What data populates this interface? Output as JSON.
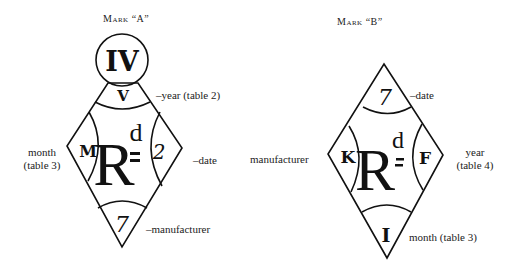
{
  "mark_a": {
    "title": "Mark “A”",
    "top_circle": "IV",
    "upper_section": "V",
    "left_section": "M",
    "center": "R",
    "center_superscript": "d",
    "right_section": "2",
    "bottom_section": "7",
    "annotations": {
      "upper": "–year  (table 2)",
      "left_line1": "month",
      "left_line2": "(table 3)",
      "right": "–date",
      "bottom": "–manufacturer"
    }
  },
  "mark_b": {
    "title": "Mark “B”",
    "top_section": "7",
    "left_section": "K",
    "center": "R",
    "center_superscript": "d",
    "right_section": "F",
    "bottom_section": "I",
    "annotations": {
      "top": "–date",
      "left": "manufacturer",
      "right_line1": "year",
      "right_line2": "(table 4)",
      "bottom": "month  (table 3)"
    }
  }
}
